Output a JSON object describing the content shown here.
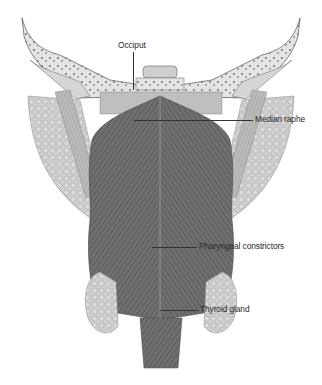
{
  "figure": {
    "type": "anatomical-illustration",
    "labels": [
      {
        "id": "occiput",
        "text": "Occiput"
      },
      {
        "id": "median-raphe",
        "text": "Median raphe"
      },
      {
        "id": "pharyngeal-constrictors",
        "text": "Pharyngeal constrictors"
      },
      {
        "id": "thyroid-gland",
        "text": "Thyroid gland"
      }
    ]
  },
  "colors": {
    "muscle": "#6e6e6e",
    "muscle_dark": "#4a4a4a",
    "bone": "#d9d9d9",
    "gland": "#c9c9c9",
    "line": "#333333"
  }
}
